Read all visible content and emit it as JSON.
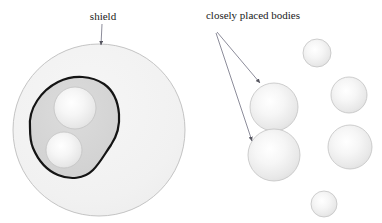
{
  "figure": {
    "title_present": false,
    "background_color": "#ffffff",
    "width": 382,
    "height": 223,
    "labels": [
      {
        "id": "shield-label",
        "text": "shield",
        "x": 103,
        "y": 20,
        "anchor": "middle"
      },
      {
        "id": "closely-placed-bodies-label",
        "text": "closely placed bodies",
        "x": 253,
        "y": 19,
        "anchor": "middle"
      }
    ],
    "annotations": [
      {
        "id": "shield-arrow",
        "from": [
          102,
          24
        ],
        "to": [
          101,
          45
        ],
        "points_at": "shield-outer-circle"
      },
      {
        "id": "bodies-arrow-upper",
        "from": [
          217,
          32
        ],
        "to": [
          262,
          84
        ],
        "points_at": "body-upper-large"
      },
      {
        "id": "bodies-arrow-lower",
        "from": [
          216,
          33
        ],
        "to": [
          254,
          142
        ],
        "points_at": "body-lower-large"
      }
    ],
    "shield_diagram": {
      "outer_circle": {
        "id": "shield-outer-circle",
        "cx": 99,
        "cy": 130,
        "r": 86,
        "fill": "#f2f2f2",
        "stroke": "#b8b8b8"
      },
      "inner_blob": {
        "id": "shield-inner-blob",
        "fill": "#d4d4d4",
        "stroke": "#1a1a1a",
        "stroke_width": 2.2,
        "description": "irregular rounded polygon enclosing two bodies"
      },
      "bodies": [
        {
          "id": "shield-body-upper",
          "cx": 75,
          "cy": 108,
          "r": 21,
          "fill": "#ededed",
          "stroke": "#c3c3c3"
        },
        {
          "id": "shield-body-lower",
          "cx": 64,
          "cy": 150,
          "r": 18,
          "fill": "#ededed",
          "stroke": "#c3c3c3"
        }
      ]
    },
    "bodies_diagram": {
      "bodies": [
        {
          "id": "body-top-small",
          "cx": 317,
          "cy": 53,
          "r": 14,
          "fill": "#ededed",
          "stroke": "#c3c3c3"
        },
        {
          "id": "body-upper-large",
          "cx": 274,
          "cy": 107,
          "r": 24,
          "fill": "#ededed",
          "stroke": "#c3c3c3"
        },
        {
          "id": "body-right-mid",
          "cx": 349,
          "cy": 95,
          "r": 18,
          "fill": "#ededed",
          "stroke": "#c3c3c3"
        },
        {
          "id": "body-lower-large",
          "cx": 274,
          "cy": 155,
          "r": 26,
          "fill": "#ededed",
          "stroke": "#c3c3c3"
        },
        {
          "id": "body-right-lower",
          "cx": 350,
          "cy": 147,
          "r": 22,
          "fill": "#ededed",
          "stroke": "#c3c3c3"
        },
        {
          "id": "body-bottom-small",
          "cx": 324,
          "cy": 204,
          "r": 13,
          "fill": "#ededed",
          "stroke": "#c3c3c3"
        }
      ]
    },
    "colors": {
      "shield_fill": "#f2f2f2",
      "blob_fill": "#d4d4d4",
      "blob_outline": "#1a1a1a",
      "body_fill": "#ededed",
      "body_outline": "#c3c3c3",
      "annotation_line": "#6e6e80",
      "text": "#1a1a1a"
    }
  }
}
